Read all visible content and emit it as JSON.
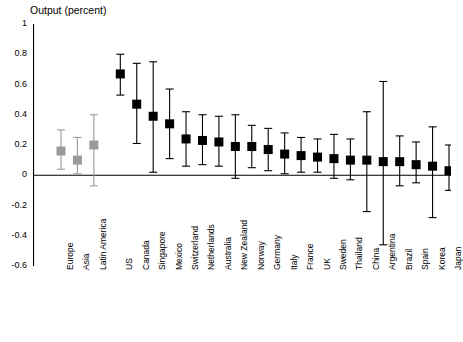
{
  "chart_data": {
    "type": "scatter",
    "title": "Output (percent)",
    "xlabel": "",
    "ylabel": "Output (percent)",
    "ylim": [
      -0.6,
      1.0
    ],
    "yticks": [
      -0.6,
      -0.4,
      -0.2,
      0,
      0.2,
      0.4,
      0.6,
      0.8,
      1
    ],
    "ytick_labels": [
      "-0.6",
      "-0.4",
      "-0.2",
      "0",
      "0.2",
      "0.4",
      "0.6",
      "0.8",
      "1"
    ],
    "grid": false,
    "legend": null,
    "zero_line": 0,
    "marker": "filled-square-with-error-bars",
    "group_colors": {
      "region": "#9a9a9a",
      "country": "#000000"
    },
    "categories": [
      "Europe",
      "Asia",
      "Latin America",
      "US",
      "Canada",
      "Singapore",
      "Mexico",
      "Switzerland",
      "Netherlands",
      "Australia",
      "New Zealand",
      "Norway",
      "Germany",
      "Italy",
      "France",
      "UK",
      "Sweden",
      "Thailand",
      "China",
      "Argentina",
      "Brazil",
      "Spain",
      "Korea",
      "Japan"
    ],
    "groups": [
      "region",
      "region",
      "region",
      "country",
      "country",
      "country",
      "country",
      "country",
      "country",
      "country",
      "country",
      "country",
      "country",
      "country",
      "country",
      "country",
      "country",
      "country",
      "country",
      "country",
      "country",
      "country",
      "country",
      "country"
    ],
    "values": [
      0.16,
      0.1,
      0.2,
      0.67,
      0.47,
      0.39,
      0.34,
      0.24,
      0.23,
      0.22,
      0.19,
      0.19,
      0.17,
      0.14,
      0.13,
      0.12,
      0.11,
      0.1,
      0.1,
      0.09,
      0.09,
      0.07,
      0.06,
      0.03
    ],
    "err_low": [
      0.04,
      0.01,
      -0.07,
      0.53,
      0.21,
      0.02,
      0.11,
      0.06,
      0.07,
      0.06,
      -0.02,
      0.05,
      0.03,
      0.01,
      0.02,
      0.02,
      -0.02,
      -0.03,
      -0.24,
      -0.46,
      -0.07,
      -0.05,
      -0.28,
      -0.1
    ],
    "err_high": [
      0.3,
      0.25,
      0.4,
      0.8,
      0.74,
      0.75,
      0.57,
      0.42,
      0.4,
      0.39,
      0.4,
      0.33,
      0.31,
      0.28,
      0.25,
      0.24,
      0.27,
      0.24,
      0.42,
      0.62,
      0.26,
      0.22,
      0.32,
      0.2
    ]
  }
}
